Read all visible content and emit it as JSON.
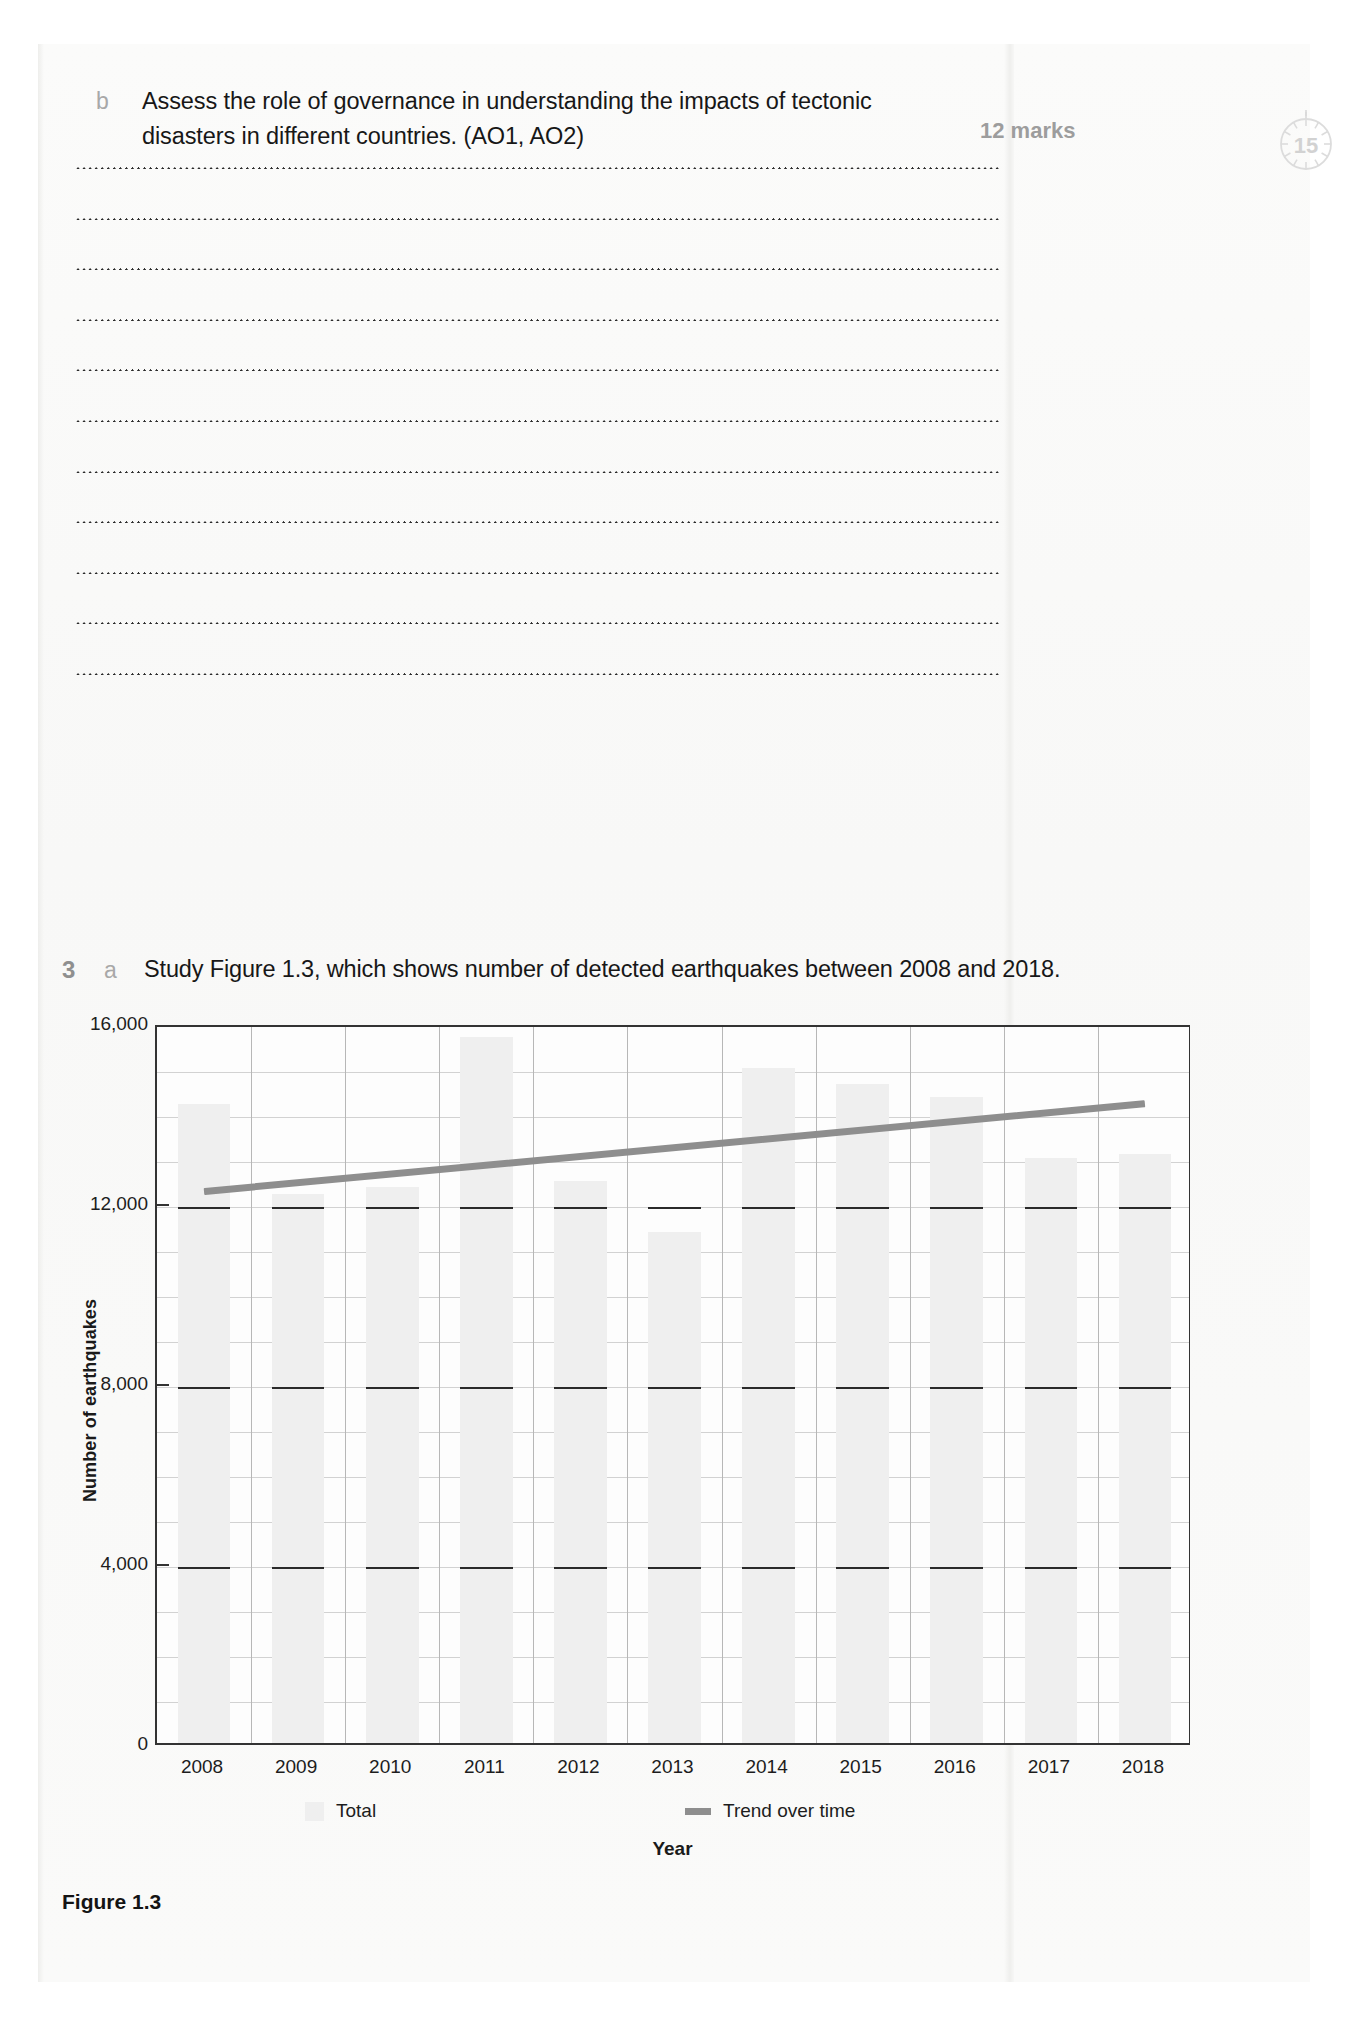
{
  "question_b": {
    "letter": "b",
    "text": "Assess the role of governance in understanding the impacts of tectonic disasters in different countries. (AO1, AO2)",
    "marks": "12 marks",
    "timer_value": "15"
  },
  "answer_lines": {
    "count": 11
  },
  "question_3": {
    "number": "3",
    "letter": "a",
    "text": "Study Figure 1.3, which shows number of detected earthquakes between 2008 and 2018."
  },
  "figure_caption": "Figure 1.3",
  "chart_data": {
    "type": "bar",
    "title": "",
    "xlabel": "Year",
    "ylabel": "Number of earthquakes",
    "categories": [
      "2008",
      "2009",
      "2010",
      "2011",
      "2012",
      "2013",
      "2014",
      "2015",
      "2016",
      "2017",
      "2018"
    ],
    "series": [
      {
        "name": "Total",
        "type": "bar",
        "color": "#efefef",
        "values": [
          14200,
          12200,
          12350,
          15700,
          12500,
          11350,
          15000,
          14650,
          14350,
          13000,
          13100
        ]
      },
      {
        "name": "Trend over time",
        "type": "line",
        "color": "#8e8e8e",
        "values": [
          12350,
          12550,
          12750,
          12950,
          13150,
          13350,
          13550,
          13750,
          13950,
          14150,
          14300
        ]
      }
    ],
    "ylim": [
      0,
      16000
    ],
    "yticks": [
      0,
      4000,
      8000,
      12000,
      16000
    ],
    "ytick_labels": [
      "0",
      "4,000",
      "8,000",
      "12,000",
      "16,000"
    ],
    "y_minor_step": 1000,
    "grid": true,
    "legend_position": "bottom",
    "legend": [
      {
        "label": "Total",
        "swatch": "bar"
      },
      {
        "label": "Trend over time",
        "swatch": "line"
      }
    ]
  }
}
